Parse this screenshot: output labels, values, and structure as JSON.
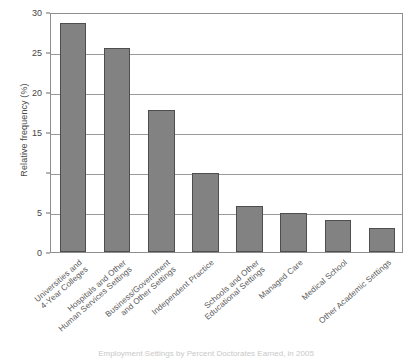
{
  "chart_data": {
    "type": "bar",
    "title": "",
    "xlabel": "",
    "ylabel": "Relative frequency (%)",
    "ylim": [
      0,
      30
    ],
    "yticks": [
      0,
      5,
      10,
      15,
      20,
      25,
      30
    ],
    "ytick_labels": [
      "0",
      "5",
      "",
      "15",
      "20",
      "25",
      "30"
    ],
    "grid": "horizontal",
    "legend": "none",
    "bar_color": "#828282",
    "bar_edge_color": "#4e4e4e",
    "categories": [
      "Universities and\n4-Year Colleges",
      "Hospitals and Other\nHuman Services Settings",
      "Business/Government\nand Other Settings",
      "Independent Practice",
      "Schools and Other\nEducational Settings",
      "Managed Care",
      "Medical School",
      "Other Academic Settings"
    ],
    "values": [
      28.6,
      25.5,
      17.8,
      9.9,
      5.8,
      4.9,
      4.0,
      3.0
    ],
    "annotations": []
  },
  "axes": {
    "y_title": "Relative frequency (%)",
    "y_tick_0": "0",
    "y_tick_5": "5",
    "y_tick_10": "",
    "y_tick_15": "15",
    "y_tick_20": "20",
    "y_tick_25": "25",
    "y_tick_30": "30"
  },
  "caption": {
    "text": "Employment Settings by Percent Doctorates Earned, in 2005"
  }
}
